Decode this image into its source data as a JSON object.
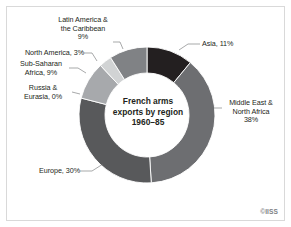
{
  "figure": {
    "background_color": "#ffffff",
    "frame_color": "#d9d9d9",
    "credit": "©IISS"
  },
  "center": {
    "line1": "French arms",
    "line2": "exports by region",
    "line3": "1960–85"
  },
  "labels": {
    "asia": "Asia, 11%",
    "mena": "Middle East &\nNorth Africa\n38%",
    "europe": "Europe, 30%",
    "russia": "Russia &\nEurasia, 0%",
    "ssa": "Sub-Saharan\nAfrica, 9%",
    "north_america": "North America, 3%",
    "latam": "Latin America &\nthe Caribbean\n9%"
  },
  "chart_data": {
    "type": "pie",
    "variant": "donut",
    "title": "French arms exports by region 1960–85",
    "subtitle": "1960–85",
    "units": "percent",
    "legend": "none",
    "labels_position": "outside-with-leader-lines",
    "start_angle_deg": 0,
    "direction": "clockwise",
    "outer_radius_px": 68,
    "inner_radius_px": 42,
    "center_px": [
      147,
      115
    ],
    "total": 100,
    "categories": [
      "Asia",
      "Middle East & North Africa",
      "Europe",
      "Russia & Eurasia",
      "Sub-Saharan Africa",
      "North America",
      "Latin America & the Caribbean"
    ],
    "values": [
      11,
      38,
      30,
      0,
      9,
      3,
      9
    ],
    "colors": [
      "#231f20",
      "#6d6e71",
      "#58595b",
      "#bcbec0",
      "#a7a9ac",
      "#d1d3d4",
      "#808285"
    ],
    "slices": [
      {
        "name": "Asia",
        "value": 11,
        "label": "Asia, 11%",
        "color": "#231f20"
      },
      {
        "name": "Middle East & North Africa",
        "value": 38,
        "label": "Middle East & North Africa 38%",
        "color": "#6d6e71"
      },
      {
        "name": "Europe",
        "value": 30,
        "label": "Europe, 30%",
        "color": "#58595b"
      },
      {
        "name": "Russia & Eurasia",
        "value": 0,
        "label": "Russia & Eurasia, 0%",
        "color": "#bcbec0"
      },
      {
        "name": "Sub-Saharan Africa",
        "value": 9,
        "label": "Sub-Saharan Africa, 9%",
        "color": "#a7a9ac"
      },
      {
        "name": "North America",
        "value": 3,
        "label": "North America, 3%",
        "color": "#d1d3d4"
      },
      {
        "name": "Latin America & the Caribbean",
        "value": 9,
        "label": "Latin America & the Caribbean 9%",
        "color": "#808285"
      }
    ]
  }
}
